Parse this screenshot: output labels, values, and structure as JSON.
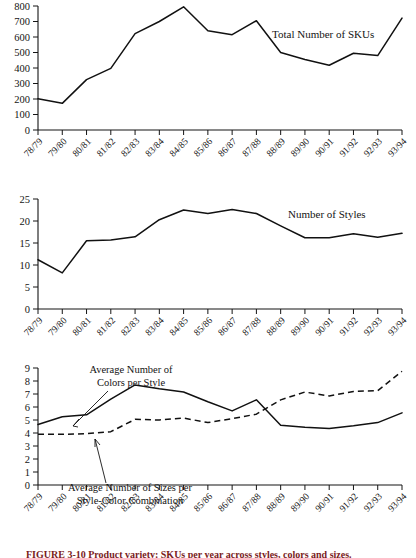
{
  "figure": {
    "caption": "FIGURE 3-10 Product variety: SKUs per year across styles, colors and sizes."
  },
  "x_categories": [
    "78/79",
    "79/80",
    "80/81",
    "81/82",
    "82/83",
    "83/84",
    "84/85",
    "85/86",
    "86/87",
    "87/88",
    "88/89",
    "89/90",
    "90/91",
    "91/92",
    "92/93",
    "93/94"
  ],
  "chart_data": [
    {
      "type": "line",
      "title": "Total Number of SKUs",
      "xlabel": "",
      "ylabel": "",
      "ylim": [
        0,
        800
      ],
      "yticks": [
        0,
        100,
        200,
        300,
        400,
        500,
        600,
        700,
        800
      ],
      "grid": false,
      "legend_position": "inline-right",
      "categories": [
        "78/79",
        "79/80",
        "80/81",
        "81/82",
        "82/83",
        "83/84",
        "84/85",
        "85/86",
        "86/87",
        "87/88",
        "88/89",
        "89/90",
        "90/91",
        "91/92",
        "92/93",
        "93/94"
      ],
      "series": [
        {
          "name": "Total Number of SKUs",
          "style": "solid",
          "values": [
            202,
            172,
            325,
            398,
            622,
            700,
            795,
            640,
            615,
            705,
            500,
            455,
            418,
            495,
            480,
            722
          ]
        }
      ]
    },
    {
      "type": "line",
      "title": "Number of Styles",
      "xlabel": "",
      "ylabel": "",
      "ylim": [
        0,
        25
      ],
      "yticks": [
        0,
        5,
        10,
        15,
        20,
        25
      ],
      "grid": false,
      "legend_position": "inline-right",
      "categories": [
        "78/79",
        "79/80",
        "80/81",
        "81/82",
        "82/83",
        "83/84",
        "84/85",
        "85/86",
        "86/87",
        "87/88",
        "88/89",
        "89/90",
        "90/91",
        "91/92",
        "92/93",
        "93/94"
      ],
      "series": [
        {
          "name": "Number of Styles",
          "style": "solid",
          "values": [
            11.2,
            8.2,
            15.5,
            15.7,
            16.4,
            20.3,
            22.5,
            21.7,
            22.6,
            21.7,
            18.9,
            16.2,
            16.2,
            17.1,
            16.3,
            17.2
          ]
        }
      ]
    },
    {
      "type": "line",
      "title": "",
      "xlabel": "",
      "ylabel": "",
      "ylim": [
        0,
        9
      ],
      "yticks": [
        0,
        1,
        2,
        3,
        4,
        5,
        6,
        7,
        8,
        9
      ],
      "grid": false,
      "legend_position": "annotated",
      "categories": [
        "78/79",
        "79/80",
        "80/81",
        "81/82",
        "82/83",
        "83/84",
        "84/85",
        "85/86",
        "86/87",
        "87/88",
        "88/89",
        "89/90",
        "90/91",
        "91/92",
        "92/93",
        "93/94"
      ],
      "series": [
        {
          "name": "Average Number of Colors per Style",
          "style": "solid",
          "values": [
            4.65,
            5.25,
            5.4,
            6.6,
            7.7,
            7.4,
            7.15,
            6.4,
            5.7,
            6.55,
            4.6,
            4.45,
            4.35,
            4.55,
            4.8,
            5.55
          ]
        },
        {
          "name": "Average Number of Sizes per Style-Color Combination",
          "style": "dashed",
          "values": [
            3.9,
            3.9,
            3.95,
            4.1,
            5.05,
            5.0,
            5.15,
            4.8,
            5.1,
            5.45,
            6.55,
            7.15,
            6.85,
            7.2,
            7.25,
            8.75
          ]
        }
      ]
    }
  ],
  "annotations": {
    "colors_line1": "Average Number of",
    "colors_line2": "Colors per Style",
    "sizes_line1": "Average Number of Sizes per",
    "sizes_line2": "Style-Color Combination"
  }
}
